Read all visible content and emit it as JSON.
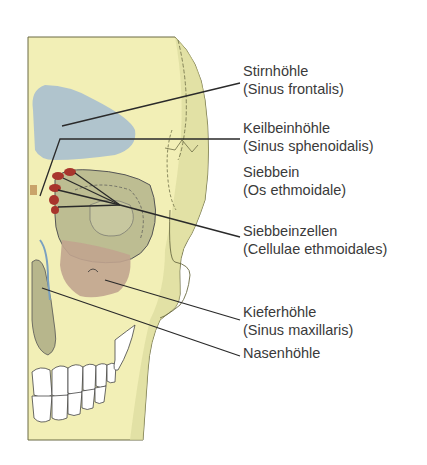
{
  "diagram": {
    "colors": {
      "bone": "#f2efb6",
      "bone_shadow": "#c9c98e",
      "frontal_sinus": "#a9bfcf",
      "maxillary_sinus": "#c1a48f",
      "orbit": "#bdbd92",
      "ethmoid_cells": "#a8352c",
      "line": "#2a2a2a"
    },
    "labels": [
      {
        "id": "stirnhoehle",
        "title": "Stirnhöhle",
        "latin": "(Sinus frontalis)"
      },
      {
        "id": "keilbeinhoehle",
        "title": "Keilbeinhöhle",
        "latin": "(Sinus sphenoidalis)"
      },
      {
        "id": "siebbein",
        "title": "Siebbein",
        "latin": "(Os ethmoidale)"
      },
      {
        "id": "siebbeinzellen",
        "title": "Siebbeinzellen",
        "latin": "(Cellulae ethmoidales)"
      },
      {
        "id": "kieferhoehle",
        "title": "Kieferhöhle",
        "latin": "(Sinus maxillaris)"
      },
      {
        "id": "nasenhoehle",
        "title": "Nasenhöhle",
        "latin": ""
      }
    ]
  }
}
